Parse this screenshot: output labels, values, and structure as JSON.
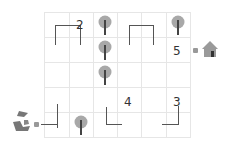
{
  "puzzle": {
    "grid": {
      "columns": 6,
      "rows": 5
    },
    "numbers": [
      {
        "label": "2",
        "x": 76,
        "y": 19
      },
      {
        "label": "5",
        "x": 173,
        "y": 45
      },
      {
        "label": "4",
        "x": 124,
        "y": 96
      },
      {
        "label": "3",
        "x": 173,
        "y": 96
      }
    ],
    "trees": [
      {
        "x": 98,
        "y": 15
      },
      {
        "x": 171,
        "y": 15
      },
      {
        "x": 98,
        "y": 40
      },
      {
        "x": 98,
        "y": 65
      },
      {
        "x": 74,
        "y": 115
      }
    ],
    "start": {
      "icon": "fox-icon"
    },
    "goal": {
      "icon": "house-icon"
    },
    "colors": {
      "grid": "#e6e6e6",
      "wall": "#555555",
      "tree": "#9a9a9a"
    }
  }
}
